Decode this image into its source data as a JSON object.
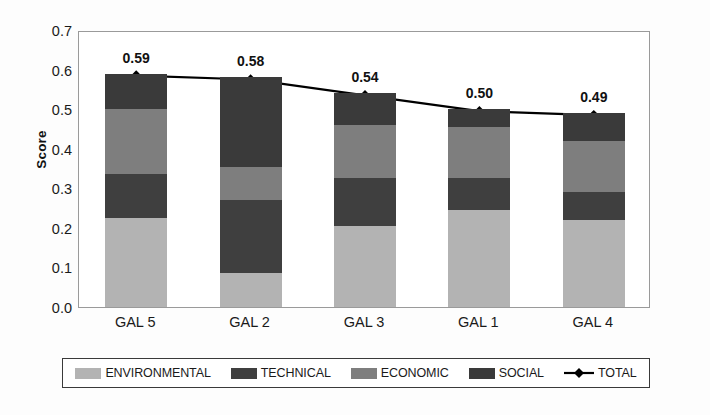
{
  "chart_data": {
    "type": "bar",
    "subtype": "stacked-bar-with-line-overlay",
    "title": "",
    "xlabel": "",
    "ylabel": "Score",
    "ylim": [
      0.0,
      0.7
    ],
    "ytick_step": 0.1,
    "ytick_labels": [
      "0.7",
      "0.6",
      "0.5",
      "0.4",
      "0.3",
      "0.2",
      "0.1",
      "0.0"
    ],
    "ytick_values": [
      0.7,
      0.6,
      0.5,
      0.4,
      0.3,
      0.2,
      0.1,
      0.0
    ],
    "grid": false,
    "legend_position": "bottom",
    "categories": [
      "GAL 5",
      "GAL 2",
      "GAL 3",
      "GAL 1",
      "GAL 4"
    ],
    "series": [
      {
        "name": "ENVIRONMENTAL",
        "type": "bar",
        "stack": "total",
        "color": "#b3b3b3",
        "values": [
          0.225,
          0.085,
          0.205,
          0.245,
          0.22
        ]
      },
      {
        "name": "TECHNICAL",
        "type": "bar",
        "stack": "total",
        "color": "#3f3f3f",
        "values": [
          0.11,
          0.185,
          0.12,
          0.08,
          0.07
        ]
      },
      {
        "name": "ECONOMIC",
        "type": "bar",
        "stack": "total",
        "color": "#7e7e7e",
        "values": [
          0.165,
          0.085,
          0.135,
          0.13,
          0.13
        ]
      },
      {
        "name": "SOCIAL",
        "type": "bar",
        "stack": "total",
        "color": "#3a3a3a",
        "values": [
          0.09,
          0.225,
          0.08,
          0.045,
          0.07
        ]
      },
      {
        "name": "TOTAL",
        "type": "line",
        "color": "#000000",
        "marker": "diamond",
        "values": [
          0.59,
          0.58,
          0.54,
          0.5,
          0.49
        ]
      }
    ],
    "data_labels": [
      "0.59",
      "0.58",
      "0.54",
      "0.50",
      "0.49"
    ],
    "annotations": []
  },
  "legend": {
    "entries": [
      {
        "label": "ENVIRONMENTAL",
        "swatch": "legend-swatch-environmental"
      },
      {
        "label": "TECHNICAL",
        "swatch": "legend-swatch-technical"
      },
      {
        "label": "ECONOMIC",
        "swatch": "legend-swatch-economic"
      },
      {
        "label": "SOCIAL",
        "swatch": "legend-swatch-social"
      },
      {
        "label": "TOTAL",
        "swatch": "legend-marker-total"
      }
    ]
  },
  "colors": {
    "environmental": "#b3b3b3",
    "technical": "#3f3f3f",
    "economic": "#7e7e7e",
    "social": "#3a3a3a",
    "total_line": "#000000",
    "axis": "#9a9a9a",
    "text": "#1a1a1a"
  }
}
